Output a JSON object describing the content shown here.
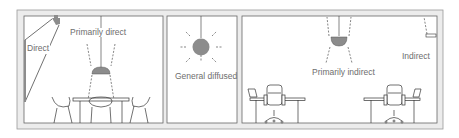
{
  "diagram": {
    "panels": [
      {
        "id": "dining",
        "labels": {
          "direct": "Direct",
          "primarily_direct": "Primarily direct"
        }
      },
      {
        "id": "diffused",
        "labels": {
          "general_diffused": "General diffused"
        }
      },
      {
        "id": "office",
        "labels": {
          "primarily_indirect": "Primarily indirect",
          "indirect": "Indirect"
        }
      }
    ],
    "colors": {
      "wall_fill": "#ececec",
      "wall_stroke": "#9a9a9a",
      "line": "#333333",
      "fixture": "#8c8c8c",
      "label": "#6e6e6e"
    }
  }
}
